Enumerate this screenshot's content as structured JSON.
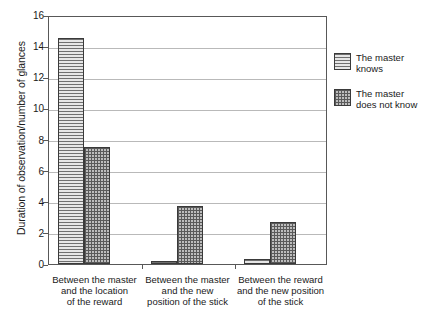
{
  "chart_data": {
    "type": "bar",
    "title": "",
    "xlabel": "",
    "ylabel": "Duration of observation/number of glances",
    "ylim": [
      0,
      16
    ],
    "ytick_step": 2,
    "yticks": [
      16,
      14,
      12,
      10,
      8,
      6,
      4,
      2,
      0
    ],
    "grid": true,
    "legend_position": "right",
    "categories": [
      "Between the master\nand the location\nof the reward",
      "Between the master\nand the new\nposition of the stick",
      "Between the reward\nand the new position\nof the stick"
    ],
    "series": [
      {
        "name": "The master knows",
        "pattern": "horizontal-lines",
        "values": [
          14.5,
          0.2,
          0.3
        ]
      },
      {
        "name": "The master does not know",
        "pattern": "crosshatch-grid",
        "values": [
          7.5,
          3.7,
          2.7
        ]
      }
    ]
  },
  "axis": {
    "y_title": "Duration of observation/number of glances",
    "y_tick_labels": [
      "16",
      "14",
      "12",
      "10",
      "8",
      "6",
      "4",
      "2",
      "0"
    ]
  },
  "categories": [
    {
      "line1": "Between the master",
      "line2": "and the location",
      "line3": "of the reward"
    },
    {
      "line1": "Between the master",
      "line2": "and the new",
      "line3": "position of the stick"
    },
    {
      "line1": "Between the reward",
      "line2": "and the new position",
      "line3": "of the stick"
    }
  ],
  "legend": {
    "items": [
      {
        "line1": "The master",
        "line2": "knows"
      },
      {
        "line1": "The master",
        "line2": "does not know"
      }
    ]
  },
  "colors": {
    "axis": "#585858",
    "gridline": "#b9b9b9",
    "bar_outline": "#3a3a3a",
    "series1_fill": "#d9d9d9",
    "series2_fill": "#bdbdbd",
    "text": "#1a1a1a",
    "background": "#ffffff"
  }
}
